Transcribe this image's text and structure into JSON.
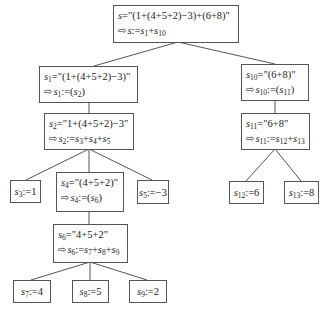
{
  "diagram": {
    "title": "",
    "type": "parse-tree",
    "arrow_glyph": "⇨",
    "nodes": [
      {
        "id": "s",
        "line1": "s=\"(1+(4+5+2)−3)+(6+8)\"",
        "line2": "s:=s1+s10"
      },
      {
        "id": "s1",
        "line1": "s1=\"(1+(4+5+2)−3)\"",
        "line2": "s1:=(s2)"
      },
      {
        "id": "s10",
        "line1": "s10=\"(6+8)\"",
        "line2": "s10:=(s11)"
      },
      {
        "id": "s2",
        "line1": "s2=\"1+(4+5+2)−3\"",
        "line2": "s2:=s3+s4+s5"
      },
      {
        "id": "s11",
        "line1": "s11=\"6+8\"",
        "line2": "s11:=s12+s13"
      },
      {
        "id": "s3",
        "line1": "s3:=1"
      },
      {
        "id": "s4",
        "line1": "s4=\"(4+5+2)\"",
        "line2": "s4:=(s6)"
      },
      {
        "id": "s5",
        "line1": "s5:=−3"
      },
      {
        "id": "s12",
        "line1": "s12:=6"
      },
      {
        "id": "s13",
        "line1": "s13:=8"
      },
      {
        "id": "s6",
        "line1": "s6=\"4+5+2\"",
        "line2": "s6:=s7+s8+s9"
      },
      {
        "id": "s7",
        "line1": "s7:=4"
      },
      {
        "id": "s8",
        "line1": "s8:=5"
      },
      {
        "id": "s9",
        "line1": "s9:=2"
      }
    ],
    "edges": [
      [
        "s",
        "s1"
      ],
      [
        "s",
        "s10"
      ],
      [
        "s1",
        "s2"
      ],
      [
        "s10",
        "s11"
      ],
      [
        "s2",
        "s3"
      ],
      [
        "s2",
        "s4"
      ],
      [
        "s2",
        "s5"
      ],
      [
        "s11",
        "s12"
      ],
      [
        "s11",
        "s13"
      ],
      [
        "s4",
        "s6"
      ],
      [
        "s6",
        "s7"
      ],
      [
        "s6",
        "s8"
      ],
      [
        "s6",
        "s9"
      ]
    ],
    "text": {
      "s_q": "=\"(1+(4+5+2)−3)+(6+8)\"",
      "s1_q": "=\"(1+(4+5+2)−3)\"",
      "s10_q": "=\"(6+8)\"",
      "s2_q": "=\"1+(4+5+2)−3\"",
      "s11_q": "=\"6+8\"",
      "s4_q": "=\"(4+5+2)\"",
      "s6_q": "=\"4+5+2\"",
      "assign": ":=",
      "plus": "+",
      "lp": "(",
      "rp": ")",
      "v_s": "s",
      "n1": "1",
      "n2": "2",
      "n3": "3",
      "n4": "4",
      "n5": "5",
      "n6": "6",
      "n7": "7",
      "n8": "8",
      "n9": "9",
      "n10": "10",
      "n11": "11",
      "n12": "12",
      "n13": "13",
      "val_s3": "1",
      "val_s5": "−3",
      "val_s12": "6",
      "val_s13": "8",
      "val_s7": "4",
      "val_s8": "5",
      "val_s9": "2"
    }
  }
}
